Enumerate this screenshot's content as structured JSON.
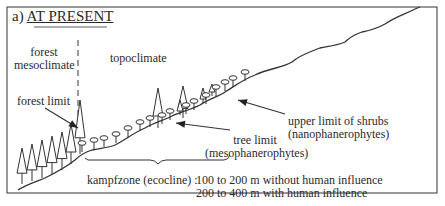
{
  "figure": {
    "panel_label": "a)",
    "title": "AT PRESENT"
  },
  "labels": {
    "forest_mesoclimate": [
      "forest",
      "mesoclimate"
    ],
    "topoclimate": "topoclimate",
    "forest_limit": "forest limit",
    "upper_limit_shrubs": [
      "upper limit of shrubs",
      "(nanophanerophytes)"
    ],
    "tree_limit": [
      "tree limit",
      "(mesophanerophytes)"
    ],
    "kampfzone": "kampfzone (ecocline) :",
    "range_without": "100 to 200 m without human influence",
    "range_with": "200 to 400 m with human influence"
  },
  "colors": {
    "line": "#333333",
    "background": "#ffffff"
  }
}
